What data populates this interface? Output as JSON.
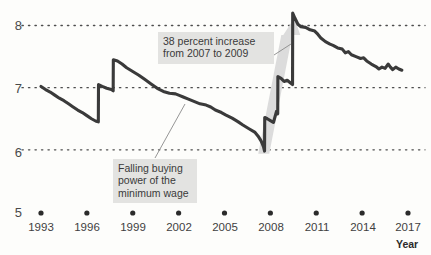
{
  "chart_data": {
    "type": "line",
    "title": "",
    "xlabel": "Year",
    "ylabel": "",
    "xlim": [
      1993,
      2017
    ],
    "ylim": [
      5,
      8
    ],
    "grid": "horizontal-dotted",
    "legend": "none",
    "x_ticks": [
      "1993",
      "1996",
      "1999",
      "2002",
      "2005",
      "2008",
      "2011",
      "2014",
      "2017"
    ],
    "y_ticks": [
      "5",
      "6",
      "7",
      "8"
    ],
    "series": [
      {
        "name": "Real value of the minimum wage",
        "color": "#3a3a3a",
        "points": [
          [
            1993.0,
            7.02
          ],
          [
            1993.3,
            6.97
          ],
          [
            1993.6,
            6.93
          ],
          [
            1993.9,
            6.88
          ],
          [
            1994.2,
            6.83
          ],
          [
            1994.5,
            6.79
          ],
          [
            1994.8,
            6.74
          ],
          [
            1995.1,
            6.69
          ],
          [
            1995.4,
            6.64
          ],
          [
            1995.7,
            6.6
          ],
          [
            1996.0,
            6.55
          ],
          [
            1996.3,
            6.5
          ],
          [
            1996.6,
            6.46
          ],
          [
            1996.75,
            6.45
          ],
          [
            1996.76,
            7.05
          ],
          [
            1997.0,
            7.02
          ],
          [
            1997.3,
            6.99
          ],
          [
            1997.6,
            6.97
          ],
          [
            1997.72,
            6.95
          ],
          [
            1997.73,
            7.45
          ],
          [
            1998.0,
            7.43
          ],
          [
            1998.3,
            7.38
          ],
          [
            1998.6,
            7.32
          ],
          [
            1999.0,
            7.26
          ],
          [
            1999.4,
            7.2
          ],
          [
            1999.8,
            7.13
          ],
          [
            2000.2,
            7.06
          ],
          [
            2000.6,
            6.99
          ],
          [
            2001.0,
            6.94
          ],
          [
            2001.4,
            6.91
          ],
          [
            2001.8,
            6.9
          ],
          [
            2002.0,
            6.88
          ],
          [
            2002.3,
            6.85
          ],
          [
            2002.6,
            6.82
          ],
          [
            2003.0,
            6.78
          ],
          [
            2003.4,
            6.74
          ],
          [
            2003.8,
            6.72
          ],
          [
            2004.1,
            6.69
          ],
          [
            2004.4,
            6.64
          ],
          [
            2004.8,
            6.6
          ],
          [
            2005.1,
            6.56
          ],
          [
            2005.5,
            6.51
          ],
          [
            2005.9,
            6.45
          ],
          [
            2006.2,
            6.4
          ],
          [
            2006.6,
            6.34
          ],
          [
            2007.0,
            6.28
          ],
          [
            2007.2,
            6.22
          ],
          [
            2007.4,
            6.14
          ],
          [
            2007.55,
            6.05
          ],
          [
            2007.6,
            6.0
          ],
          [
            2007.62,
            5.98
          ],
          [
            2007.63,
            6.52
          ],
          [
            2007.8,
            6.5
          ],
          [
            2008.0,
            6.47
          ],
          [
            2008.2,
            6.44
          ],
          [
            2008.4,
            6.62
          ],
          [
            2008.48,
            6.58
          ],
          [
            2008.49,
            7.18
          ],
          [
            2008.7,
            7.15
          ],
          [
            2008.9,
            7.1
          ],
          [
            2009.1,
            7.12
          ],
          [
            2009.3,
            7.08
          ],
          [
            2009.45,
            7.05
          ],
          [
            2009.46,
            8.2
          ],
          [
            2009.6,
            8.12
          ],
          [
            2009.8,
            8.02
          ],
          [
            2010.0,
            7.98
          ],
          [
            2010.3,
            7.97
          ],
          [
            2010.6,
            7.93
          ],
          [
            2010.9,
            7.91
          ],
          [
            2011.1,
            7.86
          ],
          [
            2011.3,
            7.8
          ],
          [
            2011.6,
            7.74
          ],
          [
            2011.9,
            7.7
          ],
          [
            2012.1,
            7.68
          ],
          [
            2012.4,
            7.64
          ],
          [
            2012.7,
            7.62
          ],
          [
            2012.9,
            7.56
          ],
          [
            2013.1,
            7.58
          ],
          [
            2013.3,
            7.53
          ],
          [
            2013.6,
            7.5
          ],
          [
            2013.9,
            7.47
          ],
          [
            2014.1,
            7.48
          ],
          [
            2014.3,
            7.43
          ],
          [
            2014.6,
            7.38
          ],
          [
            2014.9,
            7.34
          ],
          [
            2015.1,
            7.3
          ],
          [
            2015.3,
            7.33
          ],
          [
            2015.5,
            7.31
          ],
          [
            2015.7,
            7.38
          ],
          [
            2015.85,
            7.33
          ],
          [
            2016.0,
            7.29
          ],
          [
            2016.2,
            7.33
          ],
          [
            2016.4,
            7.3
          ],
          [
            2016.6,
            7.28
          ]
        ]
      }
    ],
    "annotations": [
      {
        "name": "increase-callout",
        "text": "38 percent increase\nfrom 2007 to 2009",
        "leader_from": [
          274,
          55
        ],
        "leader_to": [
          291,
          44
        ]
      },
      {
        "name": "falling-callout",
        "text": "Falling buying\npower of the\nminimum wage",
        "leader_from": [
          155,
          158
        ],
        "leader_to": [
          185,
          104
        ]
      }
    ],
    "highlight_arrow": {
      "name": "growth-arrow",
      "from_year": 2007.6,
      "from_value": 6.0,
      "to_year": 2009.5,
      "to_value": 8.2,
      "color": "#dcdcdc"
    }
  },
  "axis": {
    "year_label": "Year",
    "y_labels": [
      "8",
      "7",
      "6",
      "5"
    ],
    "x_labels": [
      "1993",
      "1996",
      "1999",
      "2002",
      "2005",
      "2008",
      "2011",
      "2014",
      "2017"
    ]
  },
  "colors": {
    "line": "#3a3a3a",
    "gridline": "#4d4d4d",
    "annotation_bg": "#e3e3e1",
    "annotation_text": "#3a3a3a",
    "arrow": "#dcdcdc",
    "background": "#fdfdfb"
  }
}
